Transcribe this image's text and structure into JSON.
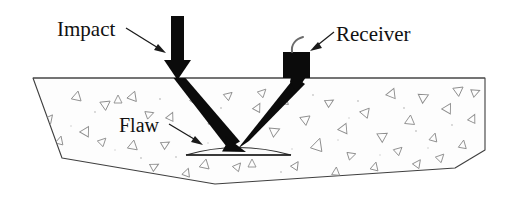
{
  "figure": {
    "width": 518,
    "height": 206,
    "background_color": "#ffffff",
    "line_color": "#3c3c3c",
    "ink_color": "#111111",
    "concrete_fill": "#fdfdfd",
    "aggregate_color": "#8d8d8d"
  },
  "labels": {
    "impact": "Impact",
    "receiver": "Receiver",
    "flaw": "Flaw"
  },
  "elements": {
    "specimen_name": "concrete specimen",
    "impact_arrow_name": "impact stress wave input",
    "incident_ray_name": "incident wave path",
    "reflected_ray_name": "reflected wave path",
    "receiver_name": "receiver transducer",
    "cable_name": "receiver cable",
    "flaw_name": "internal delamination flaw"
  },
  "geometry": {
    "specimen_outline": "33,78 62,158 215,184 455,168 485,150 485,78",
    "top_surface": {
      "x1": 33,
      "y1": 78,
      "x2": 485,
      "y2": 78
    },
    "impact_point": {
      "x": 178,
      "y": 78
    },
    "flaw_point": {
      "x": 237,
      "y": 149
    },
    "receiver_point": {
      "x": 300,
      "y": 80
    },
    "receiver_box": {
      "x": 283,
      "y": 52,
      "width": 27,
      "height": 26
    },
    "flaw_span": {
      "x1": 186,
      "x2": 291,
      "y": 155,
      "arch_top": 146
    }
  },
  "aggregate_marks": [
    {
      "x": 77,
      "y": 96,
      "r": 12,
      "s": 5
    },
    {
      "x": 106,
      "y": 104,
      "r": 55,
      "s": 5
    },
    {
      "x": 118,
      "y": 99,
      "r": 0,
      "s": 4
    },
    {
      "x": 133,
      "y": 96,
      "r": 20,
      "s": 5
    },
    {
      "x": 150,
      "y": 114,
      "r": 70,
      "s": 4
    },
    {
      "x": 86,
      "y": 131,
      "r": 30,
      "s": 5
    },
    {
      "x": 60,
      "y": 140,
      "r": 15,
      "s": 4
    },
    {
      "x": 103,
      "y": 141,
      "r": 45,
      "s": 4
    },
    {
      "x": 133,
      "y": 145,
      "r": 10,
      "s": 5
    },
    {
      "x": 166,
      "y": 144,
      "r": 60,
      "s": 4
    },
    {
      "x": 171,
      "y": 116,
      "r": 25,
      "s": 4
    },
    {
      "x": 196,
      "y": 100,
      "r": 35,
      "s": 5
    },
    {
      "x": 213,
      "y": 120,
      "r": 0,
      "s": 5
    },
    {
      "x": 229,
      "y": 95,
      "r": 50,
      "s": 4
    },
    {
      "x": 205,
      "y": 164,
      "r": 12,
      "s": 5
    },
    {
      "x": 238,
      "y": 166,
      "r": 40,
      "s": 4
    },
    {
      "x": 252,
      "y": 163,
      "r": 0,
      "s": 4
    },
    {
      "x": 258,
      "y": 107,
      "r": 28,
      "s": 4
    },
    {
      "x": 275,
      "y": 131,
      "r": 66,
      "s": 5
    },
    {
      "x": 285,
      "y": 100,
      "r": 8,
      "s": 4
    },
    {
      "x": 296,
      "y": 165,
      "r": 33,
      "s": 4
    },
    {
      "x": 306,
      "y": 119,
      "r": 52,
      "s": 5
    },
    {
      "x": 318,
      "y": 144,
      "r": 18,
      "s": 6
    },
    {
      "x": 330,
      "y": 102,
      "r": 60,
      "s": 4
    },
    {
      "x": 336,
      "y": 171,
      "r": 5,
      "s": 4
    },
    {
      "x": 344,
      "y": 128,
      "r": 24,
      "s": 5
    },
    {
      "x": 352,
      "y": 155,
      "r": 72,
      "s": 4
    },
    {
      "x": 366,
      "y": 112,
      "r": 40,
      "s": 5
    },
    {
      "x": 375,
      "y": 166,
      "r": 14,
      "s": 4
    },
    {
      "x": 383,
      "y": 136,
      "r": 58,
      "s": 5
    },
    {
      "x": 392,
      "y": 93,
      "r": 22,
      "s": 5
    },
    {
      "x": 399,
      "y": 150,
      "r": 48,
      "s": 4
    },
    {
      "x": 410,
      "y": 120,
      "r": 6,
      "s": 5
    },
    {
      "x": 418,
      "y": 163,
      "r": 36,
      "s": 4
    },
    {
      "x": 424,
      "y": 97,
      "r": 64,
      "s": 5
    },
    {
      "x": 434,
      "y": 137,
      "r": 16,
      "s": 4
    },
    {
      "x": 441,
      "y": 157,
      "r": 44,
      "s": 4
    },
    {
      "x": 448,
      "y": 108,
      "r": 30,
      "s": 5
    },
    {
      "x": 459,
      "y": 90,
      "r": 54,
      "s": 5
    },
    {
      "x": 463,
      "y": 144,
      "r": 10,
      "s": 4
    },
    {
      "x": 473,
      "y": 118,
      "r": 26,
      "s": 4
    },
    {
      "x": 476,
      "y": 92,
      "r": 68,
      "s": 4
    },
    {
      "x": 50,
      "y": 118,
      "r": 38,
      "s": 4
    },
    {
      "x": 187,
      "y": 172,
      "r": 20,
      "s": 4
    },
    {
      "x": 263,
      "y": 92,
      "r": 45,
      "s": 4
    },
    {
      "x": 155,
      "y": 166,
      "r": 62,
      "s": 4
    }
  ],
  "speckles": [
    {
      "x": 95,
      "y": 112
    },
    {
      "x": 124,
      "y": 128
    },
    {
      "x": 160,
      "y": 99
    },
    {
      "x": 190,
      "y": 135
    },
    {
      "x": 221,
      "y": 108
    },
    {
      "x": 247,
      "y": 140
    },
    {
      "x": 268,
      "y": 118
    },
    {
      "x": 292,
      "y": 149
    },
    {
      "x": 313,
      "y": 95
    },
    {
      "x": 338,
      "y": 140
    },
    {
      "x": 358,
      "y": 101
    },
    {
      "x": 380,
      "y": 155
    },
    {
      "x": 404,
      "y": 108
    },
    {
      "x": 428,
      "y": 148
    },
    {
      "x": 452,
      "y": 125
    },
    {
      "x": 470,
      "y": 160
    },
    {
      "x": 71,
      "y": 126
    },
    {
      "x": 141,
      "y": 158
    },
    {
      "x": 208,
      "y": 143
    },
    {
      "x": 281,
      "y": 172
    },
    {
      "x": 349,
      "y": 118
    },
    {
      "x": 416,
      "y": 131
    },
    {
      "x": 115,
      "y": 150
    },
    {
      "x": 176,
      "y": 157
    }
  ]
}
